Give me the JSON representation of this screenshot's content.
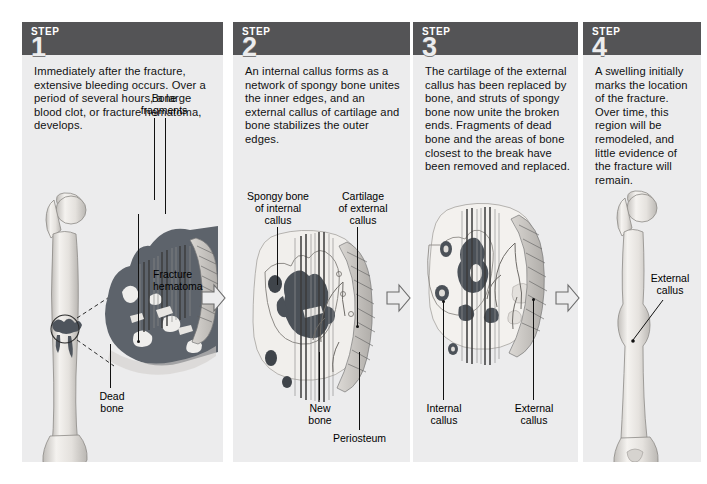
{
  "figure": {
    "panel_bg": "#ececed",
    "header_bg": "#545456",
    "bone_color": "#e9e7e4",
    "hematoma_color": "#5a5f66"
  },
  "steps": [
    {
      "word": "STEP",
      "number": "1",
      "text": "Immediately after the fracture, extensive bleeding occurs. Over a period of several hours, a large blood clot, or fracture hematoma, develops.",
      "labels": [
        {
          "name": "bone-fragments",
          "text": "Bone\nfragments"
        },
        {
          "name": "fracture-hematoma",
          "text": "Fracture\nhematoma"
        },
        {
          "name": "dead-bone",
          "text": "Dead\nbone"
        }
      ]
    },
    {
      "word": "STEP",
      "number": "2",
      "text": "An internal callus forms as a network of spongy bone unites the inner edges, and an external callus of cartilage and bone stabilizes the outer edges.",
      "labels": [
        {
          "name": "spongy-bone-of-internal-callus",
          "text": "Spongy bone\nof internal\ncallus"
        },
        {
          "name": "cartilage-of-external-callus",
          "text": "Cartilage\nof external\ncallus"
        },
        {
          "name": "new-bone",
          "text": "New\nbone"
        },
        {
          "name": "periosteum",
          "text": "Periosteum"
        }
      ]
    },
    {
      "word": "STEP",
      "number": "3",
      "text": "The cartilage of the external callus has been replaced by bone, and struts of spongy bone now unite the broken ends. Fragments of dead bone and the areas of bone closest to the break have been removed and replaced.",
      "labels": [
        {
          "name": "internal-callus",
          "text": "Internal\ncallus"
        },
        {
          "name": "external-callus",
          "text": "External\ncallus"
        }
      ]
    },
    {
      "word": "STEP",
      "number": "4",
      "text": "A swelling initially marks the location of the fracture. Over time, this region will be remodeled, and little evidence of the fracture will remain.",
      "labels": [
        {
          "name": "external-callus",
          "text": "External\ncallus"
        }
      ]
    }
  ],
  "arrows": [
    {
      "name": "arrow-step1-to-step2"
    },
    {
      "name": "arrow-step2-to-step3"
    },
    {
      "name": "arrow-step3-to-step4"
    }
  ]
}
